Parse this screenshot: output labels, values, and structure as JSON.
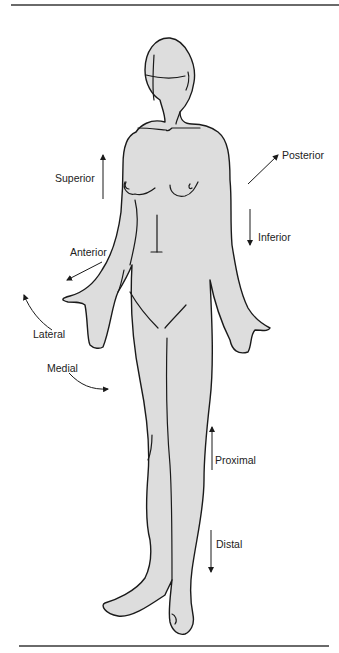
{
  "diagram": {
    "type": "anatomical-directional-terms",
    "colors": {
      "figure_fill": "#dddddd",
      "outline": "#1a1a1a",
      "rule": "#6a6a6a",
      "text": "#222222"
    },
    "labels": {
      "superior": "Superior",
      "inferior": "Inferior",
      "anterior": "Anterior",
      "posterior": "Posterior",
      "lateral": "Lateral",
      "medial": "Medial",
      "proximal": "Proximal",
      "distal": "Distal"
    },
    "arrows": [
      {
        "term": "Superior",
        "direction": "up"
      },
      {
        "term": "Inferior",
        "direction": "down"
      },
      {
        "term": "Anterior",
        "direction": "down-left"
      },
      {
        "term": "Posterior",
        "direction": "up-right"
      },
      {
        "term": "Lateral",
        "direction": "curved-outward"
      },
      {
        "term": "Medial",
        "direction": "curved-inward"
      },
      {
        "term": "Proximal",
        "direction": "up"
      },
      {
        "term": "Distal",
        "direction": "down"
      }
    ]
  }
}
